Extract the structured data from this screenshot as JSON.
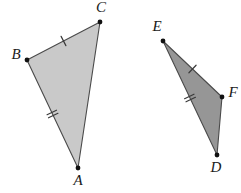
{
  "figure": {
    "background_color": "#ffffff",
    "width": 241,
    "height": 193
  },
  "style": {
    "triangle_1_fill": "#c9c9c9",
    "triangle_2_fill": "#969696",
    "stroke_color": "#4a4a4a",
    "stroke_width": 1.1,
    "tick_color": "#3a3a3a",
    "vertex_dot_color": "#111111",
    "vertex_dot_radius": 2.4,
    "label_color": "#1a1a1a",
    "label_font_size": 15
  },
  "triangles": [
    {
      "id": "triangle-abc",
      "name": "Triangle ABC",
      "fill": "#c9c9c9",
      "vertices": [
        {
          "label": "A",
          "x": 78,
          "y": 168,
          "label_x": 78,
          "label_y": 182
        },
        {
          "label": "B",
          "x": 27,
          "y": 60,
          "label_x": 16,
          "label_y": 56
        },
        {
          "label": "C",
          "x": 100,
          "y": 22,
          "label_x": 101,
          "label_y": 9
        }
      ],
      "sides": [
        {
          "from": "B",
          "to": "C",
          "ticks": 1,
          "mid_x": 63.5,
          "mid_y": 41
        },
        {
          "from": "B",
          "to": "A",
          "ticks": 2,
          "mid_x": 52.5,
          "mid_y": 114
        },
        {
          "from": "C",
          "to": "A",
          "ticks": 0,
          "mid_x": 89,
          "mid_y": 95
        }
      ]
    },
    {
      "id": "triangle-def",
      "name": "Triangle DEF",
      "fill": "#969696",
      "vertices": [
        {
          "label": "D",
          "x": 217,
          "y": 155,
          "label_x": 216,
          "label_y": 169
        },
        {
          "label": "E",
          "x": 163,
          "y": 41,
          "label_x": 157,
          "label_y": 28
        },
        {
          "label": "F",
          "x": 222,
          "y": 97,
          "label_x": 233,
          "label_y": 94
        }
      ],
      "sides": [
        {
          "from": "E",
          "to": "F",
          "ticks": 1,
          "mid_x": 192.5,
          "mid_y": 69
        },
        {
          "from": "E",
          "to": "D",
          "ticks": 2,
          "mid_x": 190,
          "mid_y": 98
        },
        {
          "from": "F",
          "to": "D",
          "ticks": 0,
          "mid_x": 219.5,
          "mid_y": 126
        }
      ]
    }
  ],
  "labels": {
    "A": "A",
    "B": "B",
    "C": "C",
    "D": "D",
    "E": "E",
    "F": "F"
  }
}
